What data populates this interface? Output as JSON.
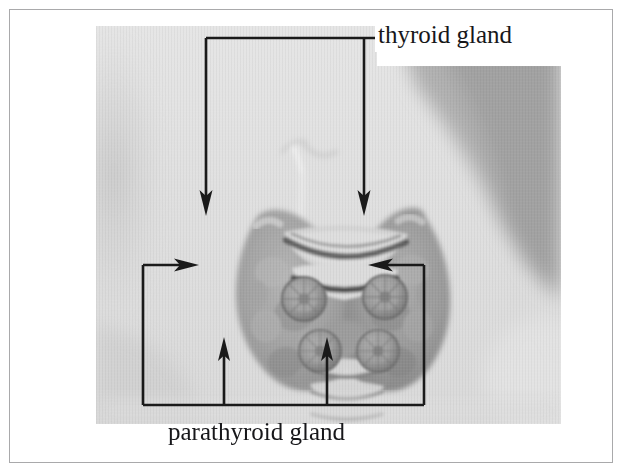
{
  "figure": {
    "kind": "anatomy-photo-diagram",
    "border_color": "#a9a9ab",
    "page_background": "#ffffff",
    "annotation_color": "#1a1a1a"
  },
  "photo": {
    "description": "grayscale photograph of a neck showing the thyroid gland lobes, tracheal cartilage rings and four round parathyroid glands",
    "tone_light": "#e3e3e3",
    "tone_mid": "#b9b9b9",
    "tone_dark": "#8c8c8c",
    "tone_darkest": "#6d6d6d"
  },
  "callouts": [
    {
      "id": "thyroid",
      "label": "thyroid gland",
      "pointer_count": 2,
      "pointer_direction": "down",
      "label_background": "#ffffff"
    },
    {
      "id": "parathyroid",
      "label": "parathyroid gland",
      "pointer_count": 4,
      "pointer_direction": "inward-and-up",
      "label_background": "none"
    }
  ],
  "labels": {
    "thyroid_gland": "thyroid gland",
    "parathyroid_gland": "parathyroid gland"
  }
}
